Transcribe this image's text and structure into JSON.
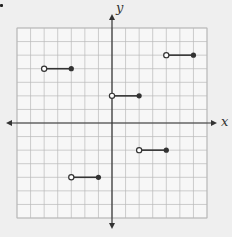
{
  "chart_data": {
    "type": "scatter",
    "title": "",
    "xlabel": "x",
    "ylabel": "y",
    "xlim": [
      -7,
      7
    ],
    "ylim": [
      -7,
      7
    ],
    "grid": true,
    "grid_step": 1,
    "tick_labels": false,
    "series": [
      {
        "name": "step-segments",
        "segments": [
          {
            "open": [
              -5,
              4
            ],
            "closed": [
              -3,
              4
            ]
          },
          {
            "open": [
              4,
              5
            ],
            "closed": [
              6,
              5
            ]
          },
          {
            "open": [
              0,
              2
            ],
            "closed": [
              2,
              2
            ]
          },
          {
            "open": [
              2,
              -2
            ],
            "closed": [
              4,
              -2
            ]
          },
          {
            "open": [
              -3,
              -4
            ],
            "closed": [
              -1,
              -4
            ]
          }
        ]
      }
    ]
  },
  "labels": {
    "x": "x",
    "y": "y"
  },
  "colors": {
    "grid": "#b8b8b8",
    "axis": "#333333",
    "segment": "#333333",
    "background": "#efefef"
  }
}
